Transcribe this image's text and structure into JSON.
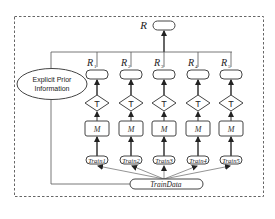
{
  "diagram": {
    "frame_style": "dashed",
    "output": {
      "label": "R"
    },
    "prior": {
      "label_line1": "Explicit Prior",
      "label_line2": "Information"
    },
    "data_source": {
      "label": "TrainData"
    },
    "columns": [
      {
        "result_label": "R",
        "result_sub": "1",
        "test_label": "T",
        "model_label": "M",
        "train_label": "Train1"
      },
      {
        "result_label": "R",
        "result_sub": "2",
        "test_label": "T",
        "model_label": "M",
        "train_label": "Train2"
      },
      {
        "result_label": "R",
        "result_sub": "3",
        "test_label": "T",
        "model_label": "M",
        "train_label": "Train3"
      },
      {
        "result_label": "R",
        "result_sub": "4",
        "test_label": "T",
        "model_label": "M",
        "train_label": "Train4"
      },
      {
        "result_label": "R",
        "result_sub": "5",
        "test_label": "T",
        "model_label": "M",
        "train_label": "Train5"
      }
    ],
    "colors": {
      "stroke": "#444444",
      "line": "#555555",
      "frame": "#666666",
      "background": "#ffffff"
    }
  }
}
